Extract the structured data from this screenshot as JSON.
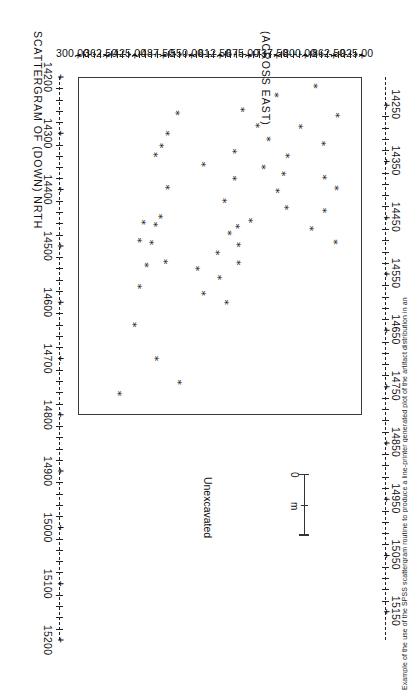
{
  "figure": {
    "title": "SCATTERGRAM OF (DOWN) NRTH",
    "across_label": "(ACROSS EAST)",
    "unexcavated_label": "Unexcavated",
    "caption": "Example of the use of the SPSS scattergram routine to produce a line-printer generated plot of the artifact distribution in an",
    "scale": {
      "zero": "0",
      "unit": "m"
    }
  },
  "chart_data": {
    "type": "scatter",
    "title": "SCATTERGRAM OF (DOWN) NRTH",
    "xlabel": "(ACROSS EAST)",
    "ylabel": "NRTH (DOWN)",
    "grid": false,
    "legend": false,
    "marker": "*",
    "xlim": [
      14150,
      15200
    ],
    "ylim": [
      300.0,
      925.0
    ],
    "x_ticks": [
      14200,
      14300,
      14400,
      14500,
      14600,
      14700,
      14800,
      14900,
      15000,
      15100,
      15200
    ],
    "x_ticklabels": [
      "14200",
      "14300",
      "14400",
      "14500",
      "14600",
      "14700",
      "14800",
      "14900",
      "15000",
      "15100",
      "15200"
    ],
    "y_ticks": [
      925.0,
      862.5,
      800.0,
      737.5,
      675.0,
      612.5,
      550.0,
      487.5,
      425.0,
      362.5,
      300.0
    ],
    "y_ticklabels": [
      "925.00",
      "862.50",
      "800.00",
      "737.50",
      "675.00",
      "612.50",
      "550.00",
      "487.50",
      "425.00",
      "362.50",
      "300.00"
    ],
    "y_minor_ticks": [
      14250,
      14350,
      14450,
      14550,
      14650,
      14750,
      14850,
      14950,
      15050,
      15150
    ],
    "y_minor_ticklabels": [
      "14250",
      "14350",
      "14450",
      "14550",
      "14650",
      "14750",
      "14850",
      "14950",
      "15050",
      "15150"
    ],
    "excavated_box": {
      "x0": 14200,
      "x1": 14800,
      "y0": 300.0,
      "y1": 925.0
    },
    "annotations": [
      {
        "text": "Unexcavated",
        "x": 14960,
        "y": 600
      }
    ],
    "points": [
      {
        "east": 14268,
        "north": 866
      },
      {
        "east": 14318,
        "north": 835
      },
      {
        "east": 14378,
        "north": 838
      },
      {
        "east": 14397,
        "north": 865
      },
      {
        "east": 14437,
        "north": 838
      },
      {
        "east": 14469,
        "north": 810
      },
      {
        "east": 14493,
        "north": 862
      },
      {
        "east": 14216,
        "north": 818
      },
      {
        "east": 14288,
        "north": 786
      },
      {
        "east": 14340,
        "north": 756
      },
      {
        "east": 14372,
        "north": 747
      },
      {
        "east": 14432,
        "north": 755
      },
      {
        "east": 14232,
        "north": 732
      },
      {
        "east": 14310,
        "north": 714
      },
      {
        "east": 14402,
        "north": 735
      },
      {
        "east": 14360,
        "north": 703
      },
      {
        "east": 14286,
        "north": 690
      },
      {
        "east": 14455,
        "north": 676
      },
      {
        "east": 14465,
        "north": 646
      },
      {
        "east": 14498,
        "north": 648
      },
      {
        "east": 14530,
        "north": 648
      },
      {
        "east": 14258,
        "north": 658
      },
      {
        "east": 14332,
        "north": 641
      },
      {
        "east": 14380,
        "north": 640
      },
      {
        "east": 14420,
        "north": 618
      },
      {
        "east": 14477,
        "north": 628
      },
      {
        "east": 14512,
        "north": 603
      },
      {
        "east": 14556,
        "north": 606
      },
      {
        "east": 14600,
        "north": 623
      },
      {
        "east": 14584,
        "north": 572
      },
      {
        "east": 14355,
        "north": 572
      },
      {
        "east": 14540,
        "north": 558
      },
      {
        "east": 14264,
        "north": 515
      },
      {
        "east": 14300,
        "north": 492
      },
      {
        "east": 14322,
        "north": 480
      },
      {
        "east": 14338,
        "north": 466
      },
      {
        "east": 14396,
        "north": 492
      },
      {
        "east": 14448,
        "north": 478
      },
      {
        "east": 14462,
        "north": 466
      },
      {
        "east": 14458,
        "north": 440
      },
      {
        "east": 14494,
        "north": 458
      },
      {
        "east": 14490,
        "north": 432
      },
      {
        "east": 14528,
        "north": 488
      },
      {
        "east": 14534,
        "north": 447
      },
      {
        "east": 14572,
        "north": 430
      },
      {
        "east": 14640,
        "north": 420
      },
      {
        "east": 14700,
        "north": 468
      },
      {
        "east": 14742,
        "north": 518
      },
      {
        "east": 14762,
        "north": 386
      }
    ]
  }
}
